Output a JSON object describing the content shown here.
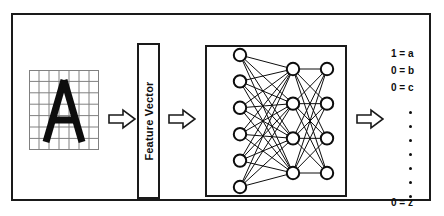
{
  "figure": {
    "frame_color": "#1a1a1a",
    "background": "#ffffff"
  },
  "input_image": {
    "name": "letter-a-grid",
    "letter": "A",
    "grid_columns": 7,
    "grid_rows": 7,
    "grid_line_color": "#808080",
    "letter_color": "#0d0d0d"
  },
  "arrows": [
    {
      "name": "arrow-image-to-feature-vector",
      "direction": "right"
    },
    {
      "name": "arrow-feature-vector-to-network",
      "direction": "right"
    },
    {
      "name": "arrow-network-to-output",
      "direction": "right"
    }
  ],
  "feature_vector": {
    "label": "Feature Vector",
    "orientation": "vertical"
  },
  "neural_network": {
    "layers": [
      {
        "name": "input-layer",
        "nodes": 6
      },
      {
        "name": "hidden-layer",
        "nodes": 4
      },
      {
        "name": "output-layer",
        "nodes": 4
      }
    ],
    "node_fill": "#ffffff",
    "node_stroke": "#0d0d0d",
    "edge_color": "#0d0d0d"
  },
  "output": {
    "rows": [
      {
        "value": "1",
        "separator": "=",
        "letter": "a",
        "text": "1 = a"
      },
      {
        "value": "0",
        "separator": "=",
        "letter": "b",
        "text": "0 = b"
      },
      {
        "value": "0",
        "separator": "=",
        "letter": "c",
        "text": "0 = c"
      }
    ],
    "ellipsis_dots": 7,
    "last_row": {
      "value": "0",
      "separator": "=",
      "letter": "z",
      "text": "0 = z"
    }
  }
}
